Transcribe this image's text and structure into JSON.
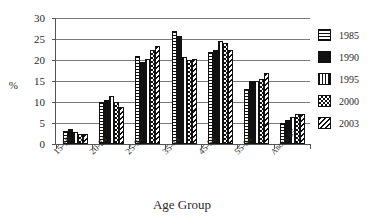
{
  "chart_data": {
    "type": "bar",
    "title": "",
    "subtitle": "",
    "xlabel": "Age Group",
    "ylabel": "%",
    "ylim": [
      0,
      30
    ],
    "y_ticks": [
      0,
      5,
      10,
      15,
      20,
      25,
      30
    ],
    "y_tick_labels": [
      "0",
      "5",
      "10",
      "15",
      "20",
      "25",
      "30"
    ],
    "grid": true,
    "legend_position": "right",
    "categories": [
      "15-19",
      "20-24",
      "25-34",
      "35-44",
      "45-54",
      "55-64",
      "Above 65"
    ],
    "series": [
      {
        "name": "1985",
        "pattern": "horizontal-lines",
        "values": [
          3.0,
          10.0,
          21.0,
          27.0,
          22.0,
          13.2,
          5.0
        ]
      },
      {
        "name": "1990",
        "pattern": "solid-black",
        "values": [
          3.5,
          10.5,
          19.5,
          25.7,
          22.5,
          15.0,
          5.7
        ]
      },
      {
        "name": "1995",
        "pattern": "vertical-lines",
        "values": [
          2.8,
          11.5,
          20.2,
          20.8,
          24.5,
          15.0,
          6.5
        ]
      },
      {
        "name": "2000",
        "pattern": "checkerboard",
        "values": [
          2.5,
          10.0,
          22.5,
          20.0,
          24.0,
          15.5,
          7.2
        ]
      },
      {
        "name": "2003",
        "pattern": "diagonal-lines",
        "values": [
          2.3,
          8.8,
          23.3,
          20.2,
          22.5,
          17.0,
          7.2
        ]
      }
    ],
    "colors": {
      "axis": "#555555",
      "gridline": "#7a7a7a",
      "bar_outline": "#111111",
      "fill_dark": "#111111",
      "fill_light": "#ffffff",
      "text": "#2a2a2a",
      "background": "#ffffff"
    }
  },
  "legend": {
    "entries": [
      {
        "label": "1985",
        "swatch": "hlines-swatch"
      },
      {
        "label": "1990",
        "swatch": "solid-swatch"
      },
      {
        "label": "1995",
        "swatch": "vlines-swatch"
      },
      {
        "label": "2000",
        "swatch": "checker-swatch"
      },
      {
        "label": "2003",
        "swatch": "diag-swatch"
      }
    ]
  }
}
